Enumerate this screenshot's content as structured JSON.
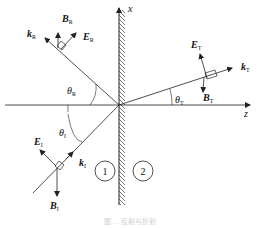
{
  "diagram": {
    "axes": {
      "x_label": "x",
      "z_label": "z"
    },
    "regions": [
      {
        "id": "medium-1",
        "label": "1"
      },
      {
        "id": "medium-2",
        "label": "2"
      }
    ],
    "incident": {
      "k": "k",
      "k_sub": "I",
      "E": "E",
      "E_sub": "I",
      "B": "B",
      "B_sub": "I",
      "angle": "θ",
      "angle_sub": "I"
    },
    "reflected": {
      "k": "k",
      "k_sub": "R",
      "E": "E",
      "E_sub": "R",
      "B": "B",
      "B_sub": "R",
      "angle": "θ",
      "angle_sub": "R"
    },
    "transmitted": {
      "k": "k",
      "k_sub": "T",
      "E": "E",
      "E_sub": "T",
      "B": "B",
      "B_sub": "T",
      "angle": "θ",
      "angle_sub": "T"
    },
    "caption": "图 … 反射与折射",
    "colors": {
      "line": "#222222",
      "caption": "#cfcfcf",
      "background": "#ffffff"
    }
  }
}
